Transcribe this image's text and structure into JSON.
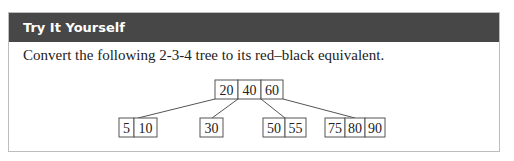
{
  "box": {
    "title": "Try It Yourself",
    "prompt": "Convert the following 2-3-4 tree to its red–black equivalent."
  },
  "tree": {
    "root": {
      "keys": [
        "20",
        "40",
        "60"
      ]
    },
    "children": [
      {
        "keys": [
          "5",
          "10"
        ]
      },
      {
        "keys": [
          "30"
        ]
      },
      {
        "keys": [
          "50",
          "55"
        ]
      },
      {
        "keys": [
          "75",
          "80",
          "90"
        ]
      }
    ]
  },
  "colors": {
    "header_bg": "#474747",
    "header_text": "#ffffff",
    "border": "#bdbdbd"
  }
}
